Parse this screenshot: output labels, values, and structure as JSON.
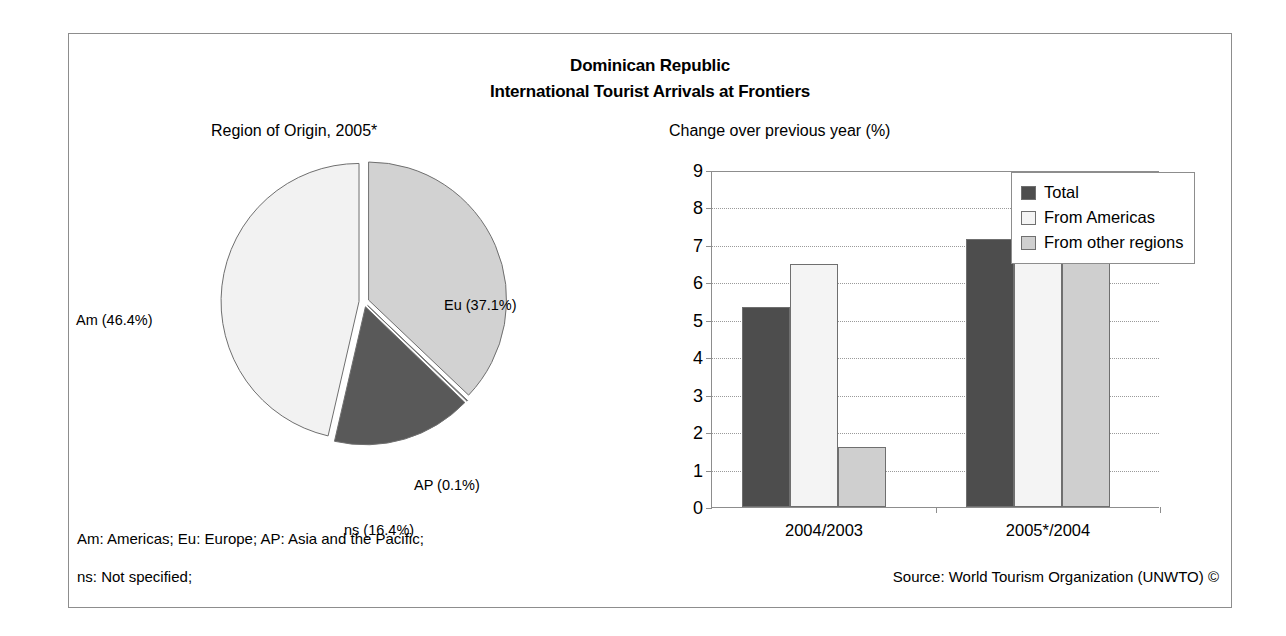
{
  "title": {
    "line1": "Dominican Republic",
    "line2": "International Tourist Arrivals at Frontiers"
  },
  "pie_subtitle": "Region of Origin, 2005*",
  "bar_subtitle": "Change over previous year (%)",
  "footnotes": {
    "abbrev_line1": "Am: Americas; Eu: Europe; AP: Asia and the Pacific;",
    "abbrev_line2": "ns: Not specified;",
    "source": "Source: World Tourism Organization (UNWTO) ©"
  },
  "colors": {
    "total": "#4d4d4d",
    "from_americas": "#f4f4f4",
    "from_other_regions": "#cfcfcf",
    "pie_eu": "#d2d2d2",
    "pie_ap": "#8f8f8f",
    "pie_ns": "#595959",
    "pie_am": "#f2f2f2",
    "frame": "#8d8d8d",
    "gridline": "#9a9a9a"
  },
  "chart_data": [
    {
      "type": "pie",
      "title": "Region of Origin, 2005*",
      "labels": [
        "Eu",
        "AP",
        "ns",
        "Am"
      ],
      "values": [
        37.1,
        0.1,
        16.4,
        46.4
      ],
      "unit": "%",
      "start_angle_deg": 0,
      "direction": "clockwise",
      "exploded": true,
      "slices": [
        {
          "key": "Eu",
          "label": "Eu (37.1%)",
          "value": 37.1,
          "color": "#d2d2d2"
        },
        {
          "key": "AP",
          "label": "AP (0.1%)",
          "value": 0.1,
          "color": "#8f8f8f"
        },
        {
          "key": "ns",
          "label": "ns (16.4%)",
          "value": 16.4,
          "color": "#595959"
        },
        {
          "key": "Am",
          "label": "Am (46.4%)",
          "value": 46.4,
          "color": "#f2f2f2"
        }
      ],
      "legend_note": "Am: Americas; Eu: Europe; AP: Asia and the Pacific; ns: Not specified;"
    },
    {
      "type": "bar",
      "title": "Change over previous year (%)",
      "categories": [
        "2004/2003",
        "2005*/2004"
      ],
      "series": [
        {
          "name": "Total",
          "values": [
            5.35,
            7.15
          ],
          "color": "#4d4d4d"
        },
        {
          "name": "From Americas",
          "values": [
            6.5,
            7.5
          ],
          "color": "#f4f4f4"
        },
        {
          "name": "From other regions",
          "values": [
            1.6,
            8.0
          ],
          "color": "#cfcfcf"
        }
      ],
      "ylabel": "",
      "xlabel": "",
      "ylim": [
        0,
        9
      ],
      "yticks": [
        0,
        1,
        2,
        3,
        4,
        5,
        6,
        7,
        8,
        9
      ],
      "grid": true,
      "legend_position": "top-right"
    }
  ]
}
